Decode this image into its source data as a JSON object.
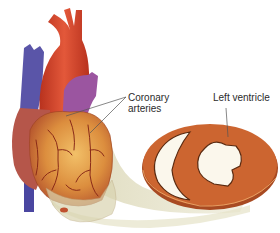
{
  "figure": {
    "labels": {
      "coronary_line1": "Coronary",
      "coronary_line2": "arteries",
      "left_ventricle": "Left ventricle"
    },
    "colors": {
      "aorta": "#d2452a",
      "vena_cava": "#5a55a8",
      "pulmonary": "#9b55a0",
      "heart_surface": "#d98a3a",
      "heart_wall": "#b85a3a",
      "vessels": "#8a2a18",
      "section_muscle": "#c8622e",
      "section_cavity": "#fbf7ec",
      "slice_plane": "#ebe8d2",
      "leader_line": "#555555"
    }
  }
}
